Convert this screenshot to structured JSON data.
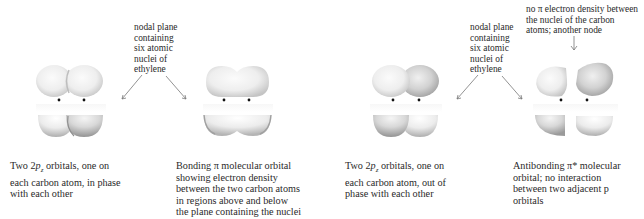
{
  "figure": {
    "panels": [
      {
        "id": "in-phase-p-orbitals",
        "caption_lines": [
          "Two 2p₂ orbitals, one on",
          "each carbon atom, in phase",
          "with each other"
        ],
        "caption_parts": {
          "pre": "Two 2",
          "italic": "p",
          "sub": "z",
          "post": " orbitals, one on"
        }
      },
      {
        "id": "bonding-pi-orbital",
        "caption_lines": [
          "Bonding π molecular orbital",
          "showing electron density",
          "between the two carbon atoms",
          "in regions above and below",
          "the plane containing the nuclei"
        ]
      },
      {
        "id": "out-of-phase-p-orbitals",
        "caption_lines": [
          "Two 2p₂ orbitals, one on",
          "each carbon atom, out of",
          "phase with each other"
        ],
        "caption_parts": {
          "pre": "Two 2",
          "italic": "p",
          "sub": "z",
          "post": " orbitals, one on"
        }
      },
      {
        "id": "antibonding-pi-star-orbital",
        "caption_lines": [
          "Antibonding π* molecular",
          "orbital; no interaction",
          "between two adjacent p",
          "orbitals"
        ]
      }
    ],
    "annotations": {
      "nodal_plane_left": [
        "nodal plane",
        "containing",
        "six atomic",
        "nuclei of",
        "ethylene"
      ],
      "nodal_plane_right": [
        "nodal plane",
        "containing",
        "six atomic",
        "nuclei of",
        "ethylene"
      ],
      "node_between_nuclei": [
        "no π electron density between",
        "the nuclei of the carbon",
        "atoms; another node"
      ]
    },
    "colors": {
      "text": "#2a2a2a",
      "lobe_light": "#f4f4f4",
      "lobe_mid": "#d6d6d6",
      "lobe_dark": "#a8a8a8",
      "arrow": "#777777",
      "nucleus": "#111111"
    }
  }
}
